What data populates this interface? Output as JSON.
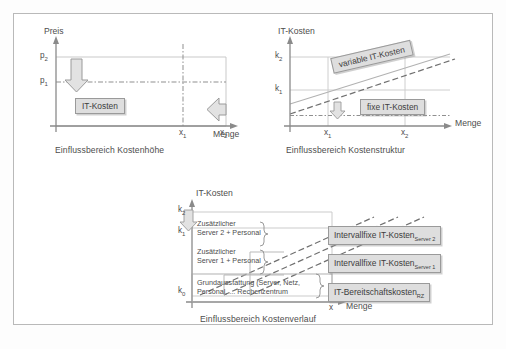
{
  "figure": {
    "title_hidden": "",
    "colors": {
      "axis": "#8a8a8a",
      "grid": "#c9c9c9",
      "box_fill": "#dedede",
      "box_border": "#9a9a9a",
      "line": "#9b9b9b",
      "frame": "#b9b9b9",
      "text": "#4d4d4d"
    }
  },
  "panel_top_left": {
    "name": "einflussbereich-kostenhoehe",
    "y_axis_label": "Preis",
    "x_axis_label": "Menge",
    "y_ticks": [
      "p",
      "p"
    ],
    "y_tick_labels": [
      {
        "base": "p",
        "sub": "2"
      },
      {
        "base": "p",
        "sub": "1"
      }
    ],
    "x_tick_labels": [
      {
        "base": "x",
        "sub": "1"
      },
      {
        "base": "x",
        "sub": "2"
      }
    ],
    "area_box_label": "IT-Kosten",
    "caption": "Einflussbereich Kostenhöhe",
    "arrow_down_name": "price-decrease-arrow",
    "arrow_left_name": "quantity-decrease-arrow"
  },
  "panel_top_right": {
    "name": "einflussbereich-kostenstruktur",
    "y_axis_label": "IT-Kosten",
    "x_axis_label": "Menge",
    "y_tick_labels": [
      {
        "base": "k",
        "sub": "2"
      },
      {
        "base": "k",
        "sub": "1"
      }
    ],
    "x_tick_labels": [
      {
        "base": "x",
        "sub": "1"
      },
      {
        "base": "x",
        "sub": "2"
      }
    ],
    "variable_cost_label": "variable IT-Kosten",
    "fixed_cost_label": "fixe IT-Kosten",
    "caption": "Einflussbereich Kostenstruktur",
    "arrow_down_name": "fixed-cost-decrease-arrow"
  },
  "panel_bottom": {
    "name": "einflussbereich-kostenverlauf",
    "y_axis_label": "IT-Kosten",
    "x_axis_label": "Menge",
    "y_tick_labels": [
      {
        "base": "k",
        "sub": "2"
      },
      {
        "base": "k",
        "sub": "1"
      },
      {
        "base": "k",
        "sub": "0"
      }
    ],
    "x_tick_label": "x",
    "caption": "Einflussbereich Kostenverlauf",
    "arrow_name": "cost-step-arrow",
    "segments": [
      {
        "inner_label_line1": "Zusätzlicher",
        "inner_label_line2": "Server 2 + Personal",
        "box_label": "Intervallfixe IT-Kosten",
        "box_sub": "Server 2"
      },
      {
        "inner_label_line1": "Zusätzlicher",
        "inner_label_line2": "Server 1 + Personal",
        "box_label": "Intervallfixe IT-Kosten",
        "box_sub": "Server 1"
      },
      {
        "inner_label_line1": "Grundausstattung (Server, Netz,",
        "inner_label_line2": "Personal, ... Rechenzentrum",
        "box_label": "IT-Bereitschaftskosten",
        "box_sub": "RZ"
      }
    ]
  }
}
